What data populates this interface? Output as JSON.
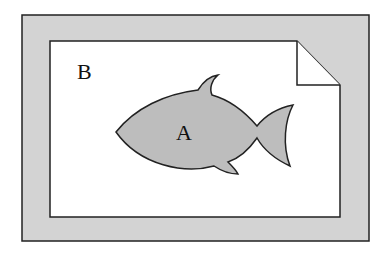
{
  "diagram": {
    "label_outer": "B",
    "label_fish": "A",
    "colors": {
      "frame_fill": "#d3d3d3",
      "paper_fill": "#ffffff",
      "fish_fill": "#bdbdbd",
      "stroke": "#222222"
    }
  }
}
